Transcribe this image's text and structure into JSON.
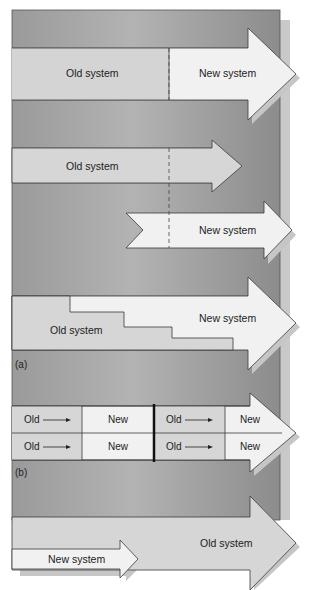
{
  "diagram": {
    "colors": {
      "panel_dark": "#8a8a8a",
      "panel_light": "#b8b8b8",
      "old_fill": "#d6d6d6",
      "new_fill": "#f0f0f0",
      "outline": "#3a3a3a",
      "shadow": "#c4c4c4"
    },
    "part_a": {
      "caption": "(a)",
      "direct": {
        "old_label": "Old system",
        "new_label": "New system"
      },
      "parallel": {
        "old_label": "Old system",
        "new_label": "New system"
      },
      "phased": {
        "old_label": "Old system",
        "new_label": "New system"
      }
    },
    "part_b": {
      "caption": "(b)",
      "rows": [
        {
          "cells": [
            {
              "label": "Old"
            },
            {
              "label": "New"
            },
            {
              "label": "Old"
            },
            {
              "label": "New"
            }
          ]
        },
        {
          "cells": [
            {
              "label": "Old"
            },
            {
              "label": "New"
            },
            {
              "label": "Old"
            },
            {
              "label": "New"
            }
          ]
        }
      ]
    },
    "part_c": {
      "old_label": "Old system",
      "new_label": "New system"
    }
  }
}
